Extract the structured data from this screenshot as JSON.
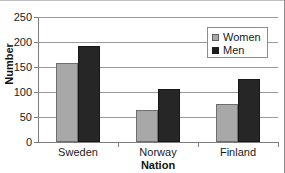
{
  "chart_data": {
    "type": "bar",
    "title": "",
    "xlabel": "Nation",
    "ylabel": "Number",
    "categories": [
      "Sweden",
      "Norway",
      "Finland"
    ],
    "series": [
      {
        "name": "Women",
        "color": "#a8a8a8",
        "values": [
          158,
          64,
          76
        ]
      },
      {
        "name": "Men",
        "color": "#262626",
        "values": [
          192,
          106,
          127
        ]
      }
    ],
    "ylim": [
      0,
      250
    ],
    "yticks": [
      0,
      50,
      100,
      150,
      200,
      250
    ],
    "ytick_labels": [
      "0",
      "50",
      "100",
      "150",
      "200",
      "250"
    ],
    "grid": true,
    "legend_position": "top-right"
  },
  "legend": {
    "items": [
      {
        "label": "Women",
        "swatch": "women-swatch"
      },
      {
        "label": "Men",
        "swatch": "men-swatch"
      }
    ]
  }
}
